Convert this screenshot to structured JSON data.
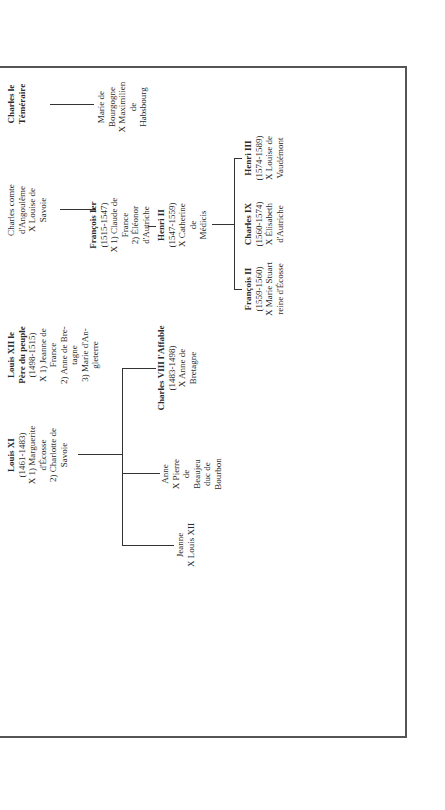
{
  "chart_title": "Genealogy of the Valois kings of France",
  "orientation": "rotated 90 degrees clockwise",
  "nodes": {
    "louis_xi": {
      "name": "Louis XI",
      "dates": "(1461-1483)",
      "lines": [
        "X 1) Marguerite",
        "d'Écosse",
        "2) Charlotte de",
        "Savoie"
      ]
    },
    "louis_xii": {
      "name": "Louis XII le",
      "name2": "Père du peuple",
      "dates": "(1498-1515)",
      "lines": [
        "X 1) Jeanne de",
        "France",
        "2) Anne de Bre-",
        "tagne",
        "3) Marie d'An-",
        "gleterre"
      ]
    },
    "charles_angouleme": {
      "lines": [
        "Charles comte",
        "d'Angoulême",
        "X Louise de",
        "Savoie"
      ]
    },
    "charles_temeraire": {
      "lines": [
        "Charles le",
        "Téméraire"
      ]
    },
    "marie_bourgogne": {
      "lines": [
        "Marie de",
        "Bourgogne",
        "X Maximilien",
        "de",
        "Habsbourg"
      ]
    },
    "francois_i": {
      "name": "François Ier",
      "dates": "(1515-1547)",
      "lines": [
        "X 1) Claude de",
        "France",
        "2) Éléonor",
        "d'Autriche"
      ]
    },
    "henri_ii": {
      "name": "Henri II",
      "dates": "(1547-1559)",
      "lines": [
        "X Catherine",
        "de",
        "Médicis"
      ]
    },
    "jeanne": {
      "lines": [
        "Jeanne",
        "X Louis XII"
      ]
    },
    "anne": {
      "lines": [
        "Anne",
        "X Pierre",
        "de",
        "Beaujeu",
        "duc de",
        "Bourbon"
      ]
    },
    "charles_viii": {
      "name": "Charles VIII l'Affable",
      "dates": "(1483-1498)",
      "lines": [
        "X Anne de",
        "Bretagne"
      ]
    },
    "francois_ii": {
      "name": "François II",
      "dates": "(1559-1560)",
      "lines": [
        "X Marie Stuart",
        "reine d'Écosse"
      ]
    },
    "charles_ix": {
      "name": "Charles IX",
      "dates": "(1560-1574)",
      "lines": [
        "X Élisabeth",
        "d'Autriche"
      ]
    },
    "henri_iii": {
      "name": "Henri III",
      "dates": "(1574-1589)",
      "lines": [
        "X Louise de",
        "Vaudémont"
      ]
    }
  },
  "colors": {
    "line": "#333333",
    "text": "#2a2a2a",
    "background": "#ffffff"
  }
}
